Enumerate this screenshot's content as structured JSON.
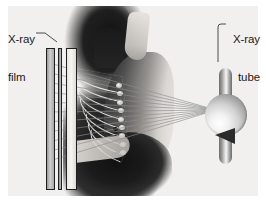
{
  "figure": {
    "background_color": "#f1f0ee",
    "margin_color": "#ffffff"
  },
  "labels": {
    "film": {
      "line1": "X-ray",
      "line2": "film"
    },
    "tube": {
      "line1": "X-ray",
      "line2": "tube"
    }
  },
  "components": {
    "film_cassette": {
      "name": "x-ray-film",
      "plate_count": 3,
      "outline_color": "#1f1f1f"
    },
    "patient": {
      "name": "patient-silhouette",
      "orientation": "lateral profile facing left",
      "silhouette_color": "#1b1b1b",
      "skin_highlight_color": "#e6e3df"
    },
    "ribcage": {
      "name": "ribcage",
      "rib_count": 9,
      "bone_color": "#efece7"
    },
    "xray_tube": {
      "name": "x-ray-tube",
      "bulb_color": "#d2d2d2",
      "anode_color": "#2b2b2b",
      "stem_color": "#8f8f8f"
    },
    "beam": {
      "name": "x-ray-beam",
      "ray_count": 11,
      "ray_color": "#8d8d8d",
      "source_x": 216,
      "source_y": 110,
      "target_x": 46
    }
  },
  "chart_data": {
    "type": "diagram",
    "annotations": [
      "X-ray film",
      "X-ray tube"
    ],
    "elements": [
      "x-ray film cassette",
      "patient lateral silhouette",
      "ribcage",
      "divergent x-ray beam",
      "x-ray tube with anode"
    ]
  }
}
